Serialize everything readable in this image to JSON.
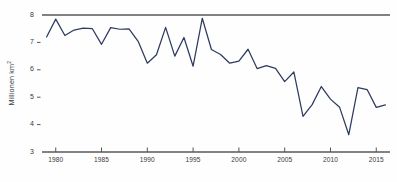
{
  "chart_data": {
    "type": "line",
    "title": "",
    "subtitle": "",
    "xlabel": "",
    "ylabel": "Millionen km²",
    "ylabel_base": "Millionen km",
    "ylabel_exponent": "2",
    "xlim": [
      1978.5,
      2016.5
    ],
    "ylim": [
      3,
      8
    ],
    "grid": false,
    "legend_position": "none",
    "line_color": "#2e3b60",
    "axis_color": "#585858",
    "y_ticks": [
      8,
      7,
      6,
      5,
      4,
      3
    ],
    "y_tick_labels": [
      "8",
      "7",
      "6",
      "5",
      "4",
      "3"
    ],
    "x_ticks": [
      1980,
      1985,
      1990,
      1995,
      2000,
      2005,
      2010,
      2015
    ],
    "x_tick_labels": [
      "1980",
      "1985",
      "1990",
      "1995",
      "2000",
      "2005",
      "2010",
      "2015"
    ],
    "series": [
      {
        "name": "Arktische Meereisausdehnung",
        "x": [
          1979,
          1980,
          1981,
          1982,
          1983,
          1984,
          1985,
          1986,
          1987,
          1988,
          1989,
          1990,
          1991,
          1992,
          1993,
          1994,
          1995,
          1996,
          1997,
          1998,
          1999,
          2000,
          2001,
          2002,
          2003,
          2004,
          2005,
          2006,
          2007,
          2008,
          2009,
          2010,
          2011,
          2012,
          2013,
          2014,
          2015,
          2016
        ],
        "values": [
          7.2,
          7.85,
          7.25,
          7.45,
          7.52,
          7.5,
          6.93,
          7.54,
          7.48,
          7.49,
          7.04,
          6.24,
          6.55,
          7.55,
          6.5,
          7.18,
          6.13,
          7.88,
          6.74,
          6.56,
          6.24,
          6.32,
          6.75,
          6.04,
          6.15,
          6.05,
          5.57,
          5.92,
          4.3,
          4.73,
          5.39,
          4.93,
          4.63,
          3.63,
          5.35,
          5.28,
          4.63,
          4.72
        ]
      }
    ],
    "annotations": []
  }
}
